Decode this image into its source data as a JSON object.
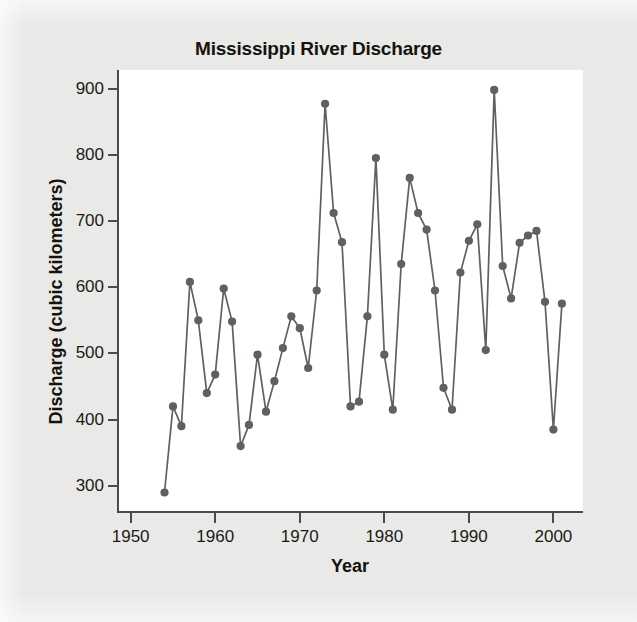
{
  "figure": {
    "title": "Mississippi River Discharge",
    "background_color": "#e9e9e7",
    "plot_background_color": "#ffffff",
    "axis_color": "#4a4a48",
    "series_color": "#5f6065"
  },
  "axes": {
    "x": {
      "label": "Year",
      "ticks": [
        1950,
        1960,
        1970,
        1980,
        1990,
        2000
      ],
      "tick_labels": [
        "1950",
        "1960",
        "1970",
        "1980",
        "1990",
        "2000"
      ],
      "min": 1948.5,
      "max": 2003.5
    },
    "y": {
      "label": "Discharge (cubic kilometers)",
      "ticks": [
        300,
        400,
        500,
        600,
        700,
        800,
        900
      ],
      "tick_labels": [
        "300",
        "400",
        "500",
        "600",
        "700",
        "800",
        "900"
      ],
      "min": 262,
      "max": 928
    }
  },
  "chart_data": {
    "type": "line",
    "title": "Mississippi River Discharge",
    "xlabel": "Year",
    "ylabel": "Discharge (cubic kilometers)",
    "xlim": [
      1948.5,
      2003.5
    ],
    "ylim": [
      262,
      928
    ],
    "grid": false,
    "legend": "none",
    "marker": "filled-circle",
    "x": [
      1954,
      1955,
      1956,
      1957,
      1958,
      1959,
      1960,
      1961,
      1962,
      1963,
      1964,
      1965,
      1966,
      1967,
      1968,
      1969,
      1970,
      1971,
      1972,
      1973,
      1974,
      1975,
      1976,
      1977,
      1978,
      1979,
      1980,
      1981,
      1982,
      1983,
      1984,
      1985,
      1986,
      1987,
      1988,
      1989,
      1990,
      1991,
      1992,
      1993,
      1994,
      1995,
      1996,
      1997,
      1998,
      1999,
      2000,
      2001
    ],
    "y": [
      290,
      420,
      390,
      608,
      550,
      440,
      468,
      598,
      548,
      360,
      392,
      498,
      412,
      458,
      508,
      556,
      538,
      478,
      595,
      877,
      712,
      668,
      420,
      427,
      556,
      795,
      498,
      415,
      635,
      765,
      712,
      687,
      595,
      448,
      415,
      622,
      670,
      695,
      505,
      898,
      632,
      583,
      667,
      678,
      685,
      578,
      385,
      575
    ],
    "categories": [
      "1954",
      "1955",
      "1956",
      "1957",
      "1958",
      "1959",
      "1960",
      "1961",
      "1962",
      "1963",
      "1964",
      "1965",
      "1966",
      "1967",
      "1968",
      "1969",
      "1970",
      "1971",
      "1972",
      "1973",
      "1974",
      "1975",
      "1976",
      "1977",
      "1978",
      "1979",
      "1980",
      "1981",
      "1982",
      "1983",
      "1984",
      "1985",
      "1986",
      "1987",
      "1988",
      "1989",
      "1990",
      "1991",
      "1992",
      "1993",
      "1994",
      "1995",
      "1996",
      "1997",
      "1998",
      "1999",
      "2000",
      "2001"
    ],
    "series": [
      {
        "name": "Discharge",
        "values": [
          290,
          420,
          390,
          608,
          550,
          440,
          468,
          598,
          548,
          360,
          392,
          498,
          412,
          458,
          508,
          556,
          538,
          478,
          595,
          877,
          712,
          668,
          420,
          427,
          556,
          795,
          498,
          415,
          635,
          765,
          712,
          687,
          595,
          448,
          415,
          622,
          670,
          695,
          505,
          898,
          632,
          583,
          667,
          678,
          685,
          578,
          385,
          575
        ]
      }
    ]
  }
}
